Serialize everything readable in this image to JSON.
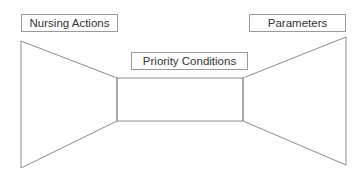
{
  "diagram": {
    "labels": {
      "left": "Nursing Actions",
      "center": "Priority Conditions",
      "right": "Parameters"
    },
    "colors": {
      "stroke": "#8c8c8c",
      "text": "#333333",
      "background": "#ffffff"
    }
  }
}
